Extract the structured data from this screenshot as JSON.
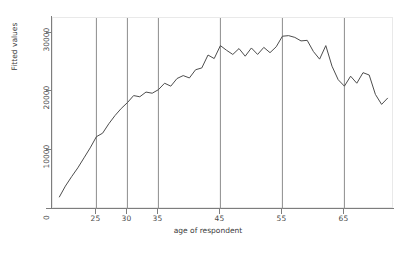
{
  "chart_data": {
    "type": "line",
    "title": "",
    "xlabel": "age of respondent",
    "ylabel": "Fitted values",
    "xlim": [
      18,
      73
    ],
    "ylim": [
      0,
      32500
    ],
    "grid": false,
    "legend": null,
    "y_ticks": [
      0,
      10000,
      20000,
      30000
    ],
    "y_tick_labels": [
      "0",
      "10000",
      "20000",
      "30000"
    ],
    "x_ticks": [
      25,
      30,
      35,
      45,
      55,
      65
    ],
    "x_tick_labels": [
      "25",
      "30",
      "35",
      "45",
      "55",
      "65"
    ],
    "reference_lines": {
      "orientation": "vertical",
      "x_values": [
        25,
        30,
        35,
        45,
        55,
        65
      ],
      "color": "#8c8c8c"
    },
    "series": [
      {
        "name": "Fitted values",
        "color": "#4d4d4d",
        "x": [
          19,
          20,
          21,
          22,
          23,
          24,
          25,
          26,
          27,
          28,
          29,
          30,
          31,
          32,
          33,
          34,
          35,
          36,
          37,
          38,
          39,
          40,
          41,
          42,
          43,
          44,
          45,
          46,
          47,
          48,
          49,
          50,
          51,
          52,
          53,
          54,
          55,
          56,
          57,
          58,
          59,
          60,
          61,
          62,
          63,
          64,
          65,
          66,
          67,
          68,
          69,
          70,
          71,
          72
        ],
        "y": [
          2000,
          3900,
          5500,
          7000,
          8700,
          10400,
          12300,
          12900,
          14500,
          15900,
          17100,
          18100,
          19300,
          19100,
          19900,
          19700,
          20300,
          21400,
          20900,
          22200,
          22700,
          22300,
          23700,
          24000,
          26200,
          25600,
          27800,
          27000,
          26300,
          27300,
          26000,
          27400,
          26300,
          27500,
          26600,
          27600,
          29400,
          29500,
          29200,
          28600,
          28700,
          26800,
          25500,
          27800,
          24300,
          22000,
          20900,
          22600,
          21400,
          23200,
          22800,
          19500,
          17800,
          18900
        ]
      }
    ]
  },
  "axis_titles": {
    "y": "Fitted values",
    "x": "age of respondent"
  }
}
